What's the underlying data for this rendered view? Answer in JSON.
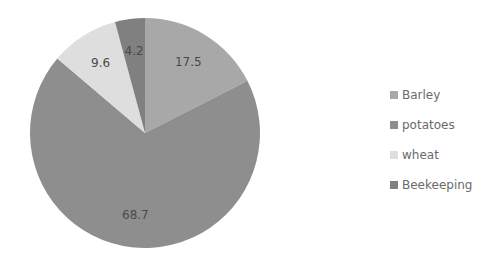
{
  "chart_data": {
    "type": "pie",
    "title": "",
    "categories": [
      "Barley",
      "potatoes",
      "wheat",
      "Beekeeping"
    ],
    "values": [
      17.5,
      68.7,
      9.6,
      4.2
    ],
    "colors": [
      "#a8a8a8",
      "#8e8e8e",
      "#dedede",
      "#808080"
    ],
    "start_angle": "12 o'clock",
    "direction": "clockwise",
    "data_labels": [
      "17.5",
      "68.7",
      "9.6",
      "4.2"
    ],
    "legend_position": "right"
  },
  "legend": {
    "items": [
      {
        "label": "Barley",
        "color": "#a8a8a8"
      },
      {
        "label": "potatoes",
        "color": "#8e8e8e"
      },
      {
        "label": "wheat",
        "color": "#dedede"
      },
      {
        "label": "Beekeeping",
        "color": "#808080"
      }
    ]
  }
}
